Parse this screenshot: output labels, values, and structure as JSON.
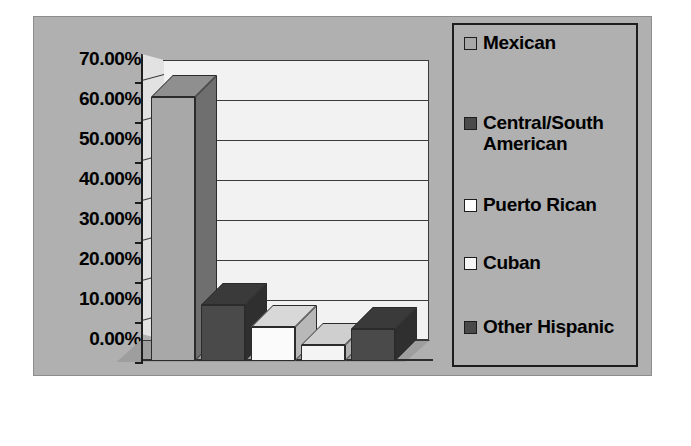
{
  "chart_data": {
    "type": "bar",
    "title": "",
    "xlabel": "",
    "ylabel": "",
    "categories": [
      "Mexican",
      "Central/South American",
      "Puerto Rican",
      "Cuban",
      "Other Hispanic"
    ],
    "values": [
      66.0,
      14.0,
      8.5,
      4.0,
      8.0
    ],
    "ylim": [
      0,
      70
    ],
    "yticks": [
      "0.00%",
      "10.00%",
      "20.00%",
      "30.00%",
      "40.00%",
      "50.00%",
      "60.00%",
      "70.00%"
    ],
    "ytick_values": [
      0,
      10,
      20,
      30,
      40,
      50,
      60,
      70
    ],
    "grid": true,
    "legend_position": "right",
    "style": "3d-column",
    "series": [
      {
        "name": "Hispanic origin",
        "values": [
          66.0,
          14.0,
          8.5,
          4.0,
          8.0
        ]
      }
    ],
    "bar_colors": [
      "#a8a8a8",
      "#4a4a4a",
      "#fbfbfb",
      "#f4f4f4",
      "#4a4a4a"
    ],
    "bar_top_colors": [
      "#8f8f8f",
      "#3a3a3a",
      "#d8d8d8",
      "#cfcfcf",
      "#3a3a3a"
    ],
    "bar_side_colors": [
      "#6f6f6f",
      "#2f2f2f",
      "#b8b8b8",
      "#b0b0b0",
      "#2f2f2f"
    ]
  },
  "legend": {
    "items": [
      {
        "label": "Mexican",
        "color": "#a8a8a8"
      },
      {
        "label": "Central/South American",
        "color": "#4a4a4a"
      },
      {
        "label": "Puerto Rican",
        "color": "#ffffff"
      },
      {
        "label": "Cuban",
        "color": "#f6f6f6"
      },
      {
        "label": "Other Hispanic",
        "color": "#4a4a4a"
      }
    ]
  },
  "colors": {
    "plate_background": "#b0b0b0",
    "plot_background": "#f2f2f2",
    "floor": "#9e9e9e",
    "axis": "#1d1d1d",
    "gridline": "#3a3a3a",
    "text": "#000000",
    "page_background": "#ffffff"
  }
}
